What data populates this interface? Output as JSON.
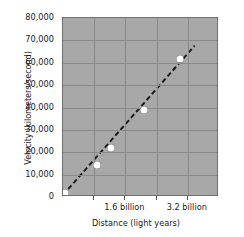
{
  "chart_data": {
    "type": "scatter",
    "title": "",
    "xlabel": "Distance (light years)",
    "ylabel": "Velocity (kilometers/second)",
    "xlim": [
      0,
      4000000000
    ],
    "ylim": [
      0,
      80000
    ],
    "grid": true,
    "legend": null,
    "background_color": "#a8a8a8",
    "point_color": "#ffffff",
    "trendline_color": "#1a1a1a",
    "trendline_style": "dashed",
    "x_tick_labels": [
      "1.6 billion",
      "3.2 billion"
    ],
    "x_tick_values": [
      1600000000,
      3200000000
    ],
    "x_gridline_values": [
      800000000,
      1600000000,
      2400000000,
      3200000000
    ],
    "y_tick_labels": [
      "80,000",
      "70,000",
      "60,000",
      "50,000",
      "40,000",
      "30,000",
      "20,000",
      "10,000",
      "0"
    ],
    "y_tick_values": [
      80000,
      70000,
      60000,
      50000,
      40000,
      30000,
      20000,
      10000,
      0
    ],
    "points": [
      {
        "x": 60000000,
        "y": 2000
      },
      {
        "x": 860000000,
        "y": 14500
      },
      {
        "x": 1230000000,
        "y": 22000
      },
      {
        "x": 2080000000,
        "y": 39000
      },
      {
        "x": 2990000000,
        "y": 61500
      }
    ],
    "trendline": {
      "x0": 0,
      "y0": 0,
      "x1": 3420000000,
      "y1": 67500
    }
  }
}
